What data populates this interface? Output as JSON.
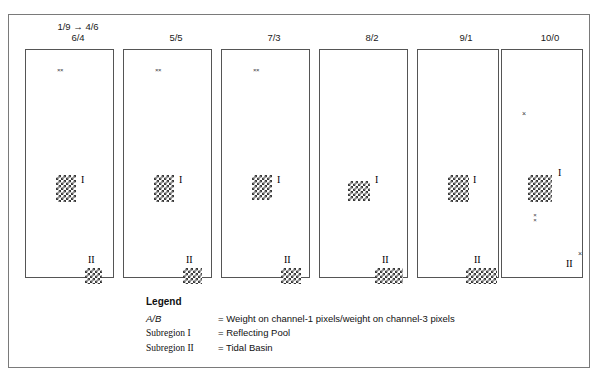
{
  "figure": {
    "columns": [
      {
        "label": "6/4",
        "transition": "1/9 → 4/6"
      },
      {
        "label": "5/5",
        "transition": ""
      },
      {
        "label": "7/3",
        "transition": ""
      },
      {
        "label": "8/2",
        "transition": ""
      },
      {
        "label": "9/1",
        "transition": ""
      },
      {
        "label": "10/0",
        "transition": ""
      }
    ],
    "region_labels": {
      "one": "I",
      "two": "II"
    },
    "speckles": {
      "single": "×",
      "pair": "××"
    }
  },
  "legend": {
    "title": "Legend",
    "rows": [
      {
        "key": "A/B",
        "italic": true,
        "value": "= Weight on channel-1 pixels/weight on channel-3 pixels"
      },
      {
        "key": "Subregion I",
        "italic": false,
        "value": "= Reflecting Pool"
      },
      {
        "key": "Subregion II",
        "italic": false,
        "value": "= Tidal Basin"
      }
    ]
  },
  "colors": {
    "frame": "#7a7a7a",
    "panel_border": "#555555",
    "checker": "#3a3a3a",
    "text": "#111111",
    "background": "#ffffff"
  }
}
